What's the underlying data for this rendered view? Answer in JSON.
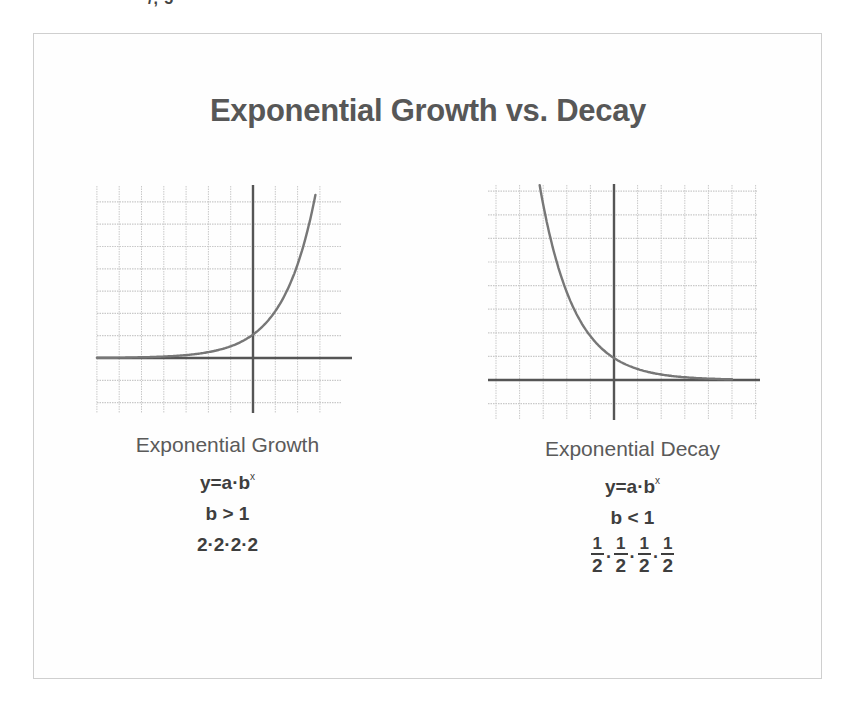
{
  "top_fragment": "/, 5",
  "title": "Exponential Growth vs. Decay",
  "colors": {
    "title": "#575757",
    "grid": "#c9c9c9",
    "axis": "#555555",
    "curve": "#777777",
    "card_border": "#cfcfcf"
  },
  "growth": {
    "name": "Exponential Growth",
    "formula_base": "y=a·b",
    "formula_exp": "x",
    "condition": "b > 1",
    "example": "2·2·2·2"
  },
  "decay": {
    "name": "Exponential Decay",
    "formula_base": "y=a·b",
    "formula_exp": "x",
    "condition": "b < 1",
    "example_fractions": [
      {
        "num": "1",
        "den": "2"
      },
      {
        "num": "1",
        "den": "2"
      },
      {
        "num": "1",
        "den": "2"
      },
      {
        "num": "1",
        "den": "2"
      }
    ],
    "example_separator": "·"
  },
  "chart_data": [
    {
      "type": "line",
      "title": "Exponential Growth",
      "xlabel": "",
      "ylabel": "",
      "grid": true,
      "xlim": [
        -7,
        4.5
      ],
      "ylim": [
        -2.5,
        7.5
      ],
      "series": [
        {
          "name": "y=a·b^x (b>1)",
          "x": [
            -7,
            -6,
            -5,
            -4,
            -3,
            -2,
            -1,
            0,
            1,
            2,
            2.9
          ],
          "y": [
            0.01,
            0.02,
            0.03,
            0.06,
            0.13,
            0.25,
            0.5,
            1.0,
            2.0,
            4.0,
            7.4
          ]
        }
      ]
    },
    {
      "type": "line",
      "title": "Exponential Decay",
      "xlabel": "",
      "ylabel": "",
      "grid": true,
      "xlim": [
        -5.5,
        6.2
      ],
      "ylim": [
        -1.5,
        8.2
      ],
      "series": [
        {
          "name": "y=a·b^x (b<1)",
          "x": [
            -3.1,
            -2,
            -1,
            0,
            1,
            2,
            3,
            4,
            5
          ],
          "y": [
            8.0,
            3.6,
            1.8,
            0.9,
            0.45,
            0.22,
            0.12,
            0.06,
            0.03
          ]
        }
      ]
    }
  ]
}
